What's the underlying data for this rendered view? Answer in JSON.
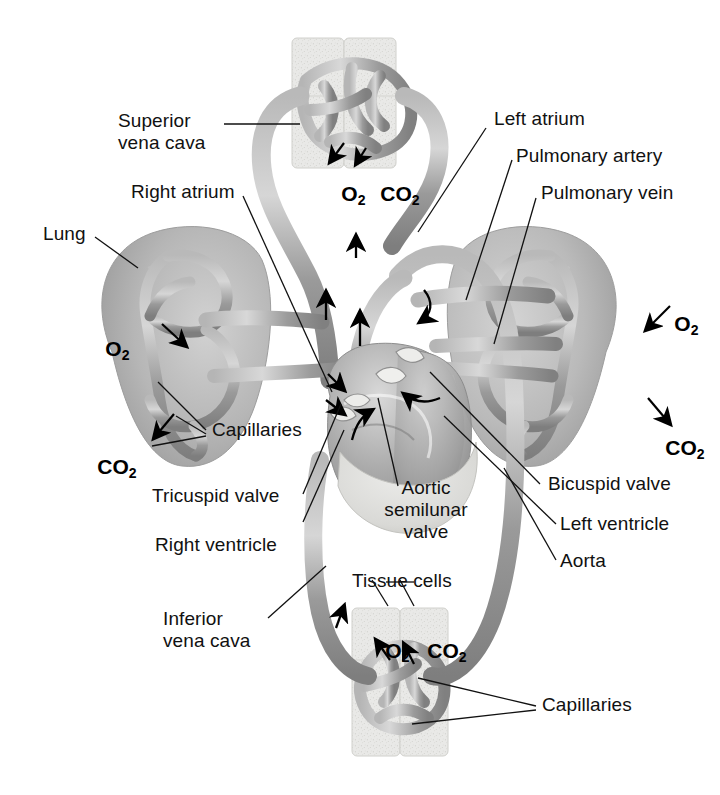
{
  "figure": {
    "type": "anatomical-diagram",
    "background_color": "#ffffff",
    "line_color": "#111111",
    "vessel_tone_dark": "#8c8c8c",
    "vessel_tone_mid": "#a8a8a8",
    "vessel_tone_light": "#c9c9c9",
    "tissue_block_color": "#e6e6e4"
  },
  "labels": {
    "superior_vena_cava": "Superior\nvena cava",
    "right_atrium": "Right atrium",
    "lung_left": "Lung",
    "left_atrium": "Left atrium",
    "pulmonary_artery": "Pulmonary artery",
    "pulmonary_vein": "Pulmonary vein",
    "capillaries_lung": "Capillaries",
    "tricuspid_valve": "Tricuspid valve",
    "right_ventricle": "Right ventricle",
    "aortic_semilunar_valve": "Aortic\nsemilunar\nvalve",
    "bicuspid_valve": "Bicuspid valve",
    "left_ventricle": "Left ventricle",
    "aorta": "Aorta",
    "inferior_vena_cava": "Inferior\nvena cava",
    "tissue_cells": "Tissue cells",
    "capillaries_tissue": "Capillaries"
  },
  "gas_labels": {
    "top_o2": "O",
    "top_o2_sub": "2",
    "top_co2": "CO",
    "top_co2_sub": "2",
    "left_lung_o2": "O",
    "left_lung_o2_sub": "2",
    "left_lung_co2": "CO",
    "left_lung_co2_sub": "2",
    "right_lung_o2": "O",
    "right_lung_o2_sub": "2",
    "right_lung_co2": "CO",
    "right_lung_co2_sub": "2",
    "bottom_o2": "O",
    "bottom_o2_sub": "2",
    "bottom_co2": "CO",
    "bottom_co2_sub": "2"
  }
}
